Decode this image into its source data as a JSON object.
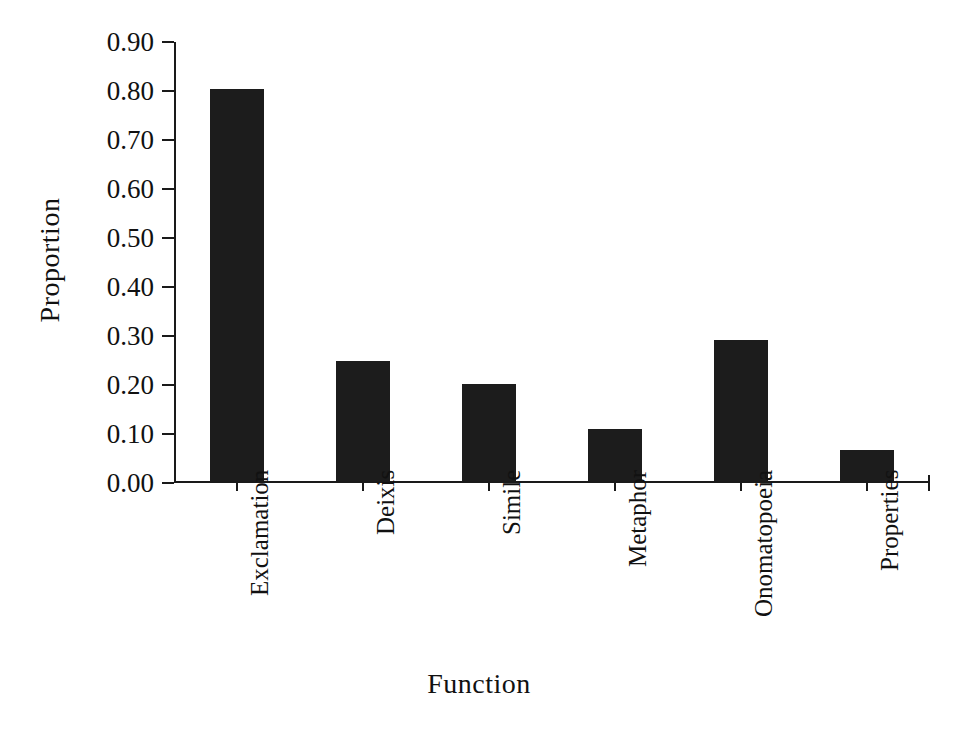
{
  "chart_data": {
    "type": "bar",
    "title": "",
    "xlabel": "Function",
    "ylabel": "Proportion",
    "categories": [
      "Exclamation",
      "Deixis",
      "Simile",
      "Metaphor",
      "Onomatopoeia",
      "Properties"
    ],
    "values": [
      0.8,
      0.245,
      0.197,
      0.107,
      0.287,
      0.063
    ],
    "ylim": [
      0.0,
      0.9
    ],
    "ytick_values": [
      0.0,
      0.1,
      0.2,
      0.3,
      0.4,
      0.5,
      0.6,
      0.7,
      0.8,
      0.9
    ],
    "ytick_labels": [
      "0.00",
      "0.10",
      "0.20",
      "0.30",
      "0.40",
      "0.50",
      "0.60",
      "0.70",
      "0.80",
      "0.90"
    ],
    "grid": false,
    "legend": false,
    "bar_color": "#1c1c1c",
    "axis_color": "#1a1a1a"
  }
}
